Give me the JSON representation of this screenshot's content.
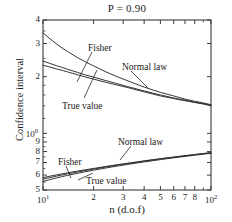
{
  "chart_data": {
    "type": "line",
    "title": "P = 0.90",
    "xlabel": "n (d.o.f)",
    "ylabel": "Confidence interval",
    "xscale": "log",
    "yscale": "log",
    "xlim": [
      10,
      100
    ],
    "ylim": [
      0.5,
      4
    ],
    "grid": false,
    "legend": "inline-annotations",
    "x_tick_labels": [
      "10¹",
      "2",
      "3",
      "4",
      "5",
      "6",
      "7",
      "8",
      "10²"
    ],
    "x_tick_values": [
      10,
      20,
      30,
      40,
      50,
      60,
      70,
      80,
      100
    ],
    "y_tick_labels": [
      "4",
      "3",
      "2",
      "10⁰",
      "9",
      "8",
      "7",
      "6",
      "5"
    ],
    "y_tick_values": [
      4,
      3,
      2,
      1,
      0.9,
      0.8,
      0.7,
      0.6,
      0.5
    ],
    "annotations": [
      {
        "text": "Fisher",
        "x": 88,
        "y": 43
      },
      {
        "text": "Normal law",
        "x": 122,
        "y": 62
      },
      {
        "text": "True value",
        "x": 62,
        "y": 101
      },
      {
        "text": "Fisher",
        "x": 58,
        "y": 157
      },
      {
        "text": "Normal law",
        "x": 118,
        "y": 137
      },
      {
        "text": "True value",
        "x": 86,
        "y": 176
      }
    ],
    "series": [
      {
        "name": "Fisher upper",
        "x": [
          10,
          11,
          12,
          13,
          14,
          16,
          18,
          20,
          24,
          28,
          32,
          40,
          50,
          60,
          70,
          80,
          90,
          100
        ],
        "y": [
          3.42,
          3.18,
          2.99,
          2.84,
          2.72,
          2.53,
          2.39,
          2.28,
          2.11,
          1.99,
          1.9,
          1.76,
          1.65,
          1.58,
          1.52,
          1.48,
          1.45,
          1.42
        ]
      },
      {
        "name": "Normal law upper",
        "x": [
          10,
          11,
          12,
          13,
          14,
          16,
          18,
          20,
          24,
          28,
          32,
          40,
          50,
          60,
          70,
          80,
          90,
          100
        ],
        "y": [
          2.42,
          2.35,
          2.29,
          2.24,
          2.19,
          2.11,
          2.04,
          1.99,
          1.9,
          1.83,
          1.77,
          1.68,
          1.6,
          1.54,
          1.5,
          1.46,
          1.44,
          1.41
        ]
      },
      {
        "name": "True value upper",
        "x": [
          10,
          11,
          12,
          13,
          14,
          16,
          18,
          20,
          24,
          28,
          32,
          40,
          50,
          60,
          70,
          80,
          90,
          100
        ],
        "y": [
          2.3,
          2.25,
          2.2,
          2.16,
          2.12,
          2.05,
          1.99,
          1.94,
          1.86,
          1.8,
          1.75,
          1.66,
          1.58,
          1.53,
          1.49,
          1.46,
          1.43,
          1.4
        ]
      },
      {
        "name": "Fisher lower",
        "x": [
          10,
          11,
          12,
          13,
          14,
          16,
          18,
          20,
          24,
          28,
          32,
          40,
          50,
          60,
          70,
          80,
          90,
          100
        ],
        "y": [
          0.555,
          0.568,
          0.579,
          0.589,
          0.598,
          0.613,
          0.626,
          0.637,
          0.656,
          0.671,
          0.684,
          0.705,
          0.725,
          0.741,
          0.754,
          0.765,
          0.775,
          0.783
        ]
      },
      {
        "name": "Normal law lower",
        "x": [
          10,
          11,
          12,
          13,
          14,
          16,
          18,
          20,
          24,
          28,
          32,
          40,
          50,
          60,
          70,
          80,
          90,
          100
        ],
        "y": [
          0.582,
          0.592,
          0.601,
          0.609,
          0.617,
          0.63,
          0.641,
          0.651,
          0.668,
          0.682,
          0.694,
          0.714,
          0.733,
          0.748,
          0.761,
          0.771,
          0.781,
          0.789
        ]
      },
      {
        "name": "True value lower",
        "x": [
          10,
          11,
          12,
          13,
          14,
          16,
          18,
          20,
          24,
          28,
          32,
          40,
          50,
          60,
          70,
          80,
          90,
          100
        ],
        "y": [
          0.571,
          0.582,
          0.592,
          0.601,
          0.609,
          0.623,
          0.635,
          0.646,
          0.664,
          0.679,
          0.691,
          0.712,
          0.732,
          0.747,
          0.76,
          0.771,
          0.78,
          0.788
        ]
      }
    ]
  },
  "colors": {
    "axis": "#3a3a3a",
    "curve": "#2b2b2b",
    "background": "#ffffff"
  }
}
